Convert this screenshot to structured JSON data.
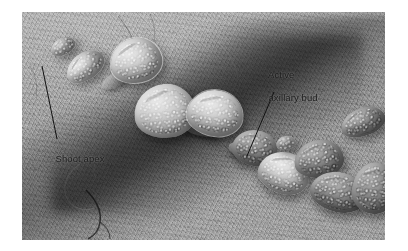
{
  "figure": {
    "kind": "scanning-electron-micrograph",
    "frame": {
      "x": 22,
      "y": 12,
      "width": 363,
      "height": 228
    },
    "page_background": "#ffffff",
    "micrograph_tone": "#989898"
  },
  "annotations": [
    {
      "id": "shoot-apex",
      "label": "Shoot apex",
      "text_x": 50,
      "text_y": 141,
      "leader": {
        "x1": 42,
        "y1": 66,
        "x2": 57,
        "y2": 139
      },
      "color": "#1b1b1b"
    },
    {
      "id": "active-axillary-bud",
      "label_line1": "Active",
      "label_line2": "axillary bud",
      "text_x": 263,
      "text_y": 57,
      "leader": {
        "x1": 274,
        "y1": 92,
        "x2": 247,
        "y2": 156
      },
      "color": "#1b1b1b"
    }
  ],
  "structures": {
    "primordia": [
      {
        "name": "apical-primordium",
        "x": 28,
        "y": 26,
        "w": 26,
        "h": 17,
        "rot": -28
      },
      {
        "name": "primordium-2",
        "x": 42,
        "y": 41,
        "w": 42,
        "h": 27,
        "rot": -36
      },
      {
        "name": "primordium-3-rimmed",
        "x": 88,
        "y": 26,
        "w": 52,
        "h": 45,
        "rot": -14
      },
      {
        "name": "primordium-4-large",
        "x": 112,
        "y": 72,
        "w": 62,
        "h": 54,
        "rot": -6
      },
      {
        "name": "primordium-5-rimmed",
        "x": 165,
        "y": 78,
        "w": 56,
        "h": 46,
        "rot": 8
      },
      {
        "name": "axillary-bud-cluster-a",
        "x": 210,
        "y": 118,
        "w": 46,
        "h": 36,
        "rot": 12
      },
      {
        "name": "axillary-bud-cluster-b",
        "x": 236,
        "y": 140,
        "w": 52,
        "h": 42,
        "rot": 18
      },
      {
        "name": "axillary-bud-cluster-c",
        "x": 272,
        "y": 128,
        "w": 50,
        "h": 38,
        "rot": -8
      },
      {
        "name": "axillary-bud-cluster-d",
        "x": 288,
        "y": 160,
        "w": 56,
        "h": 40,
        "rot": 14
      },
      {
        "name": "lateral-leaf-right",
        "x": 318,
        "y": 96,
        "w": 46,
        "h": 28,
        "rot": -20
      },
      {
        "name": "lateral-leaf-far-right",
        "x": 330,
        "y": 150,
        "w": 44,
        "h": 52,
        "rot": 6
      }
    ],
    "internodes": [
      {
        "name": "internode-upper",
        "x": 78,
        "y": 60,
        "w": 34,
        "h": 14,
        "rot": -30
      },
      {
        "name": "internode-mid",
        "x": 160,
        "y": 108,
        "w": 40,
        "h": 16,
        "rot": 12
      },
      {
        "name": "internode-lower",
        "x": 206,
        "y": 132,
        "w": 30,
        "h": 14,
        "rot": 20
      }
    ]
  }
}
